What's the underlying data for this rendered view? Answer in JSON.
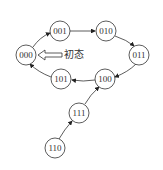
{
  "diagram": {
    "type": "state-transition",
    "initial_label": "初态",
    "nodes": [
      {
        "id": "000",
        "label": "000",
        "x": 26,
        "y": 55
      },
      {
        "id": "001",
        "label": "001",
        "x": 60,
        "y": 31
      },
      {
        "id": "010",
        "label": "010",
        "x": 106,
        "y": 31
      },
      {
        "id": "011",
        "label": "011",
        "x": 139,
        "y": 55
      },
      {
        "id": "100",
        "label": "100",
        "x": 105,
        "y": 79
      },
      {
        "id": "101",
        "label": "101",
        "x": 61,
        "y": 79
      },
      {
        "id": "111",
        "label": "111",
        "x": 79,
        "y": 113
      },
      {
        "id": "110",
        "label": "110",
        "x": 55,
        "y": 148
      }
    ],
    "edges": [
      {
        "from": "000",
        "to": "001"
      },
      {
        "from": "001",
        "to": "010"
      },
      {
        "from": "010",
        "to": "011"
      },
      {
        "from": "011",
        "to": "100"
      },
      {
        "from": "100",
        "to": "101"
      },
      {
        "from": "101",
        "to": "000"
      },
      {
        "from": "110",
        "to": "111"
      },
      {
        "from": "111",
        "to": "100"
      }
    ],
    "initial_state": "000"
  }
}
